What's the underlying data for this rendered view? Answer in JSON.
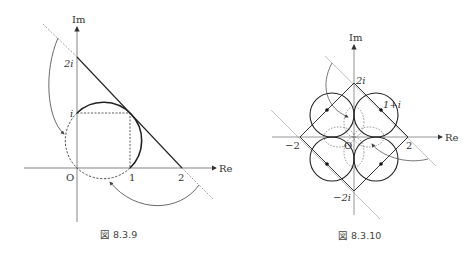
{
  "figures": [
    {
      "id": "left",
      "caption": "図 8.3.9",
      "axis_labels": {
        "x": "Re",
        "y": "Im"
      },
      "tick_labels": {
        "origin": "O",
        "one": "1",
        "two": "2",
        "i": "i",
        "two_i": "2i"
      },
      "description": "Line Re+Im=2 mapped to circle through O, 1, i, 1+i; dashed square to 1+i; curved arrows from dashed line extensions to dashed half of circle"
    },
    {
      "id": "right",
      "caption": "図 8.3.10",
      "axis_labels": {
        "x": "Re",
        "y": "Im"
      },
      "tick_labels": {
        "origin": "O",
        "two": "2",
        "neg_two": "−2",
        "two_i": "2i",
        "neg_two_i": "−2i",
        "one_plus_i": "1+i"
      },
      "description": "Square |Re|+|Im|=2 mapped to four circles of radius 1 centered at ±1±i; dotted inner lobes; curved arrows from gray diagonal lines"
    }
  ]
}
